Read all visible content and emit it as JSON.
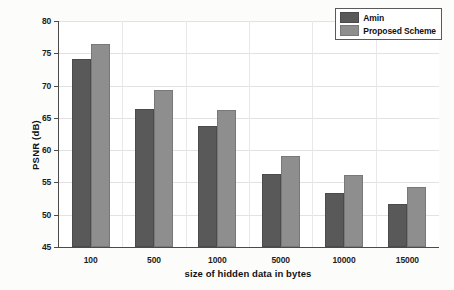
{
  "chart_data": {
    "type": "bar",
    "title": "",
    "xlabel": "size of hidden data in bytes",
    "ylabel": "PSNR (dB)",
    "categories": [
      "100",
      "500",
      "1000",
      "5000",
      "10000",
      "15000"
    ],
    "series": [
      {
        "name": "Amin",
        "color": "#595959",
        "values": [
          74.1,
          66.4,
          63.7,
          56.3,
          53.4,
          51.6
        ]
      },
      {
        "name": "Proposed Scheme",
        "color": "#8e8e8e",
        "values": [
          76.5,
          69.3,
          66.2,
          59.1,
          56.1,
          54.3
        ]
      }
    ],
    "ylim": [
      45,
      80
    ],
    "yticks": [
      45,
      50,
      55,
      60,
      65,
      70,
      75,
      80
    ],
    "ytick_labels": [
      "45",
      "50",
      "55",
      "60",
      "65",
      "70",
      "75",
      "80"
    ],
    "grid": true,
    "legend_position": "top-right"
  },
  "legend": {
    "entries": [
      {
        "label": "Amin"
      },
      {
        "label": "Proposed Scheme"
      }
    ]
  }
}
